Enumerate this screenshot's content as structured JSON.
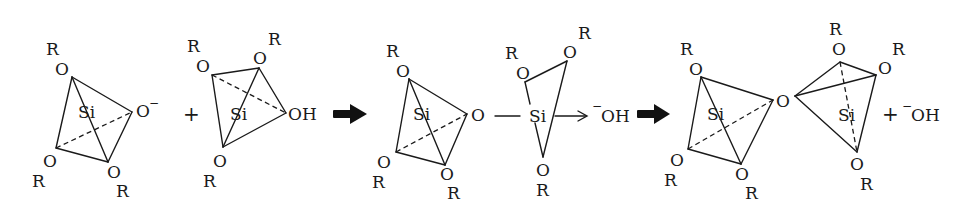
{
  "diagram": {
    "colors": {
      "ink": "#1a1a1a",
      "background": "#ffffff"
    },
    "labels": {
      "R": "R",
      "O": "O",
      "Si": "Si",
      "OH": "OH",
      "O_minus": "O",
      "minus": "−",
      "plus": "+"
    },
    "species": [
      {
        "id": "silanolate",
        "description": "Tetrahedral Si with three OR groups and one O−",
        "center": "Si",
        "substituents": [
          "OR",
          "OR",
          "OR",
          "O−"
        ]
      },
      {
        "id": "silanol",
        "description": "Tetrahedral Si with three OR groups and one OH",
        "center": "Si",
        "substituents": [
          "OR",
          "OR",
          "OR",
          "OH"
        ]
      },
      {
        "id": "intermediate",
        "description": "Si–O–Si bond forming with departing −OH",
        "leaving_group": "−OH"
      },
      {
        "id": "siloxane",
        "description": "Two tetrahedral Si linked by bridging O",
        "byproduct": "−OH"
      }
    ],
    "operators": [
      "+",
      "→",
      "→",
      "+"
    ]
  }
}
